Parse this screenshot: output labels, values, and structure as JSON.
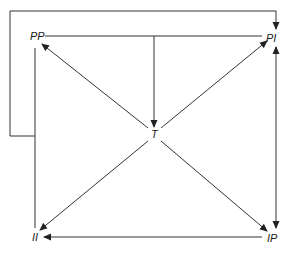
{
  "diagram": {
    "type": "directed-graph",
    "colors": {
      "line": "#333333",
      "text": "#1a1a1a",
      "background": "#ffffff"
    },
    "nodes": [
      {
        "id": "PP",
        "label": "PP",
        "x": 30,
        "y": 31
      },
      {
        "id": "PI",
        "label": "PI",
        "x": 266,
        "y": 33
      },
      {
        "id": "T",
        "label": "T",
        "x": 151,
        "y": 129
      },
      {
        "id": "II",
        "label": "II",
        "x": 32,
        "y": 232
      },
      {
        "id": "IP",
        "label": "IP",
        "x": 267,
        "y": 233
      }
    ],
    "edges": [
      {
        "from": "T",
        "to": "PP",
        "style": "arrow"
      },
      {
        "from": "T",
        "to": "PI",
        "style": "arrow"
      },
      {
        "from": "T",
        "to": "II",
        "style": "arrow"
      },
      {
        "from": "T",
        "to": "IP",
        "style": "arrow"
      },
      {
        "from": "PP-PI line",
        "to": "T",
        "style": "arrow"
      },
      {
        "from": "PP",
        "to": "PI",
        "style": "line"
      },
      {
        "from": "PP",
        "to": "II",
        "style": "line"
      },
      {
        "from": "IP",
        "to": "II",
        "style": "arrow"
      },
      {
        "from": "PI",
        "to": "IP",
        "style": "bidirectional"
      },
      {
        "from": "PP-II line",
        "to": "PI",
        "style": "loop-arrow"
      }
    ]
  }
}
